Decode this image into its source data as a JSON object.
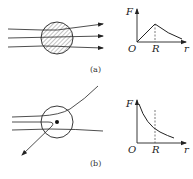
{
  "figure": {
    "panels": [
      {
        "id": "a",
        "caption": "(a)",
        "description": "particles passing through a uniformly charged sphere",
        "graph": {
          "y_label": "F",
          "x_label": "r",
          "origin_label": "O",
          "marker_label": "R",
          "shape": "linear rise to peak at R, then decay"
        }
      },
      {
        "id": "b",
        "caption": "(b)",
        "description": "particles scattered by a point nucleus",
        "graph": {
          "y_label": "F",
          "x_label": "r",
          "origin_label": "O",
          "marker_label": "R",
          "shape": "monotonic decay (inverse square)"
        }
      }
    ],
    "colors": {
      "line": "#222222",
      "hatch": "#555555",
      "background": "#ffffff"
    }
  }
}
